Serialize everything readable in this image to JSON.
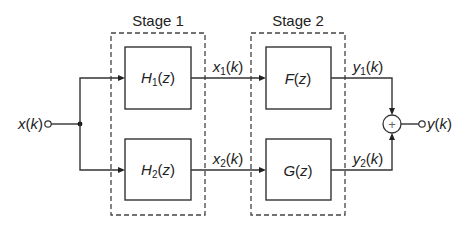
{
  "diagram": {
    "type": "block-diagram",
    "stages": [
      {
        "label": "Stage 1",
        "blocks": [
          {
            "name": "H",
            "sub": "1",
            "arg": "(z)"
          },
          {
            "name": "H",
            "sub": "2",
            "arg": "(z)"
          }
        ]
      },
      {
        "label": "Stage 2",
        "blocks": [
          {
            "name": "F",
            "sub": "",
            "arg": "(z)"
          },
          {
            "name": "G",
            "sub": "",
            "arg": "(z)"
          }
        ]
      }
    ],
    "input": {
      "name": "x",
      "arg": "(k)"
    },
    "output": {
      "name": "y",
      "arg": "(k)"
    },
    "signals": {
      "x1": {
        "name": "x",
        "sub": "1",
        "arg": "(k)"
      },
      "x2": {
        "name": "x",
        "sub": "2",
        "arg": "(k)"
      },
      "y1": {
        "name": "y",
        "sub": "1",
        "arg": "(k)"
      },
      "y2": {
        "name": "y",
        "sub": "2",
        "arg": "(k)"
      }
    },
    "summer_symbol": "+",
    "connections": [
      "x(k) -> H1(z)",
      "x(k) -> H2(z)",
      "H1(z) -> F(z) [x1(k)]",
      "H2(z) -> G(z) [x2(k)]",
      "F(z) -> summer [y1(k)]",
      "G(z) -> summer [y2(k)]",
      "summer -> y(k)"
    ]
  }
}
